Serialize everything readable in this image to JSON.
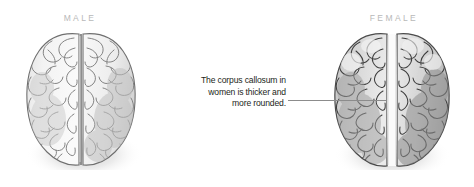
{
  "figure": {
    "background_color": "#ffffff"
  },
  "labels": {
    "male": "MALE",
    "female": "FEMALE",
    "color": "#b8b8b8"
  },
  "annotation": {
    "line1": "The corpus callosum in",
    "line2": "women is thicker and",
    "line3": "more rounded.",
    "full_text": "The corpus callosum in women is thicker and more rounded.",
    "color": "#231f20",
    "align": "right"
  },
  "leader_line": {
    "name": "leader-line",
    "color": "#8c8c8c",
    "from_x": 288,
    "to_x": 386,
    "y": 100
  },
  "brains": [
    {
      "id": "male",
      "label": "MALE",
      "view": "superior (top-down)",
      "fissure_style": "narrow dark longitudinal fissure",
      "fissure_width_px": 2,
      "fissure_color": "#8e8e8e",
      "tint": "#f2f2f2",
      "outline_color": "#6f6f6f"
    },
    {
      "id": "female",
      "label": "FEMALE",
      "view": "superior (top-down)",
      "fissure_style": "wide pale corpus callosum band",
      "fissure_width_px": 7,
      "fissure_color": "#fbfbfb",
      "tint": "#d9d9d9",
      "outline_color": "#4a4a4a"
    }
  ]
}
